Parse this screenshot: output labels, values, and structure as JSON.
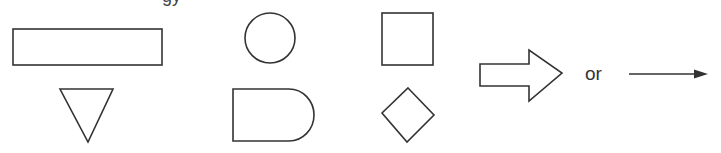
{
  "header": {
    "cut_text": "gy"
  },
  "shapes": [
    {
      "name": "rectangle",
      "meaning": "process"
    },
    {
      "name": "circle",
      "meaning": "connector"
    },
    {
      "name": "square",
      "meaning": "process"
    },
    {
      "name": "block-arrow",
      "meaning": "flow direction"
    },
    {
      "name": "inverted-triangle",
      "meaning": "merge"
    },
    {
      "name": "delay",
      "meaning": "delay"
    },
    {
      "name": "diamond",
      "meaning": "decision"
    },
    {
      "name": "line-arrow",
      "meaning": "flow direction"
    }
  ],
  "labels": {
    "or": "or"
  },
  "colors": {
    "stroke": "#333333",
    "background": "#ffffff"
  }
}
